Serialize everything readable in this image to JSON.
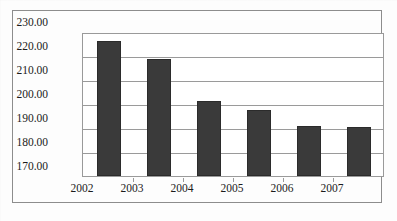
{
  "chart_data": {
    "type": "bar",
    "title": "",
    "subtitle": "",
    "xlabel": "",
    "ylabel": "",
    "categories": [
      "2002",
      "2003",
      "2004",
      "2005",
      "2006",
      "2007"
    ],
    "values": [
      226.3,
      218.7,
      201.1,
      197.6,
      191.0,
      190.6
    ],
    "series": [
      {
        "name": "",
        "values": [
          226.3,
          218.7,
          201.1,
          197.6,
          191.0,
          190.6
        ]
      }
    ],
    "ylim": [
      170.0,
      230.0
    ],
    "ytick_step": 10.0,
    "ytick_labels": [
      "230.00",
      "220.00",
      "210.00",
      "200.00",
      "190.00",
      "180.00",
      "170.00"
    ],
    "ytick_values": [
      230.0,
      220.0,
      210.0,
      200.0,
      190.0,
      180.0,
      170.0
    ],
    "grid": true,
    "legend": false,
    "legend_position": "none",
    "bar_color": "#3a3a3a",
    "bar_border_color": "#2b2b2b",
    "grid_color": "#9a9a9a",
    "plot_background": "#ffffff",
    "frame_color": "#8d8d8d"
  }
}
